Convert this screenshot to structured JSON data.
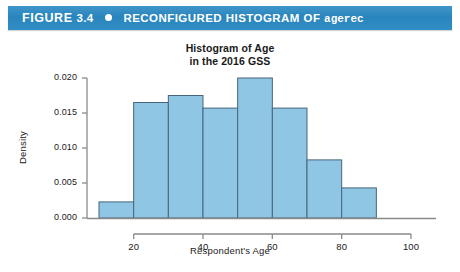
{
  "banner": {
    "figure_word": "FIGURE",
    "figure_number": "3.4",
    "bullet": "bullet-dot",
    "title_prefix": "RECONFIGURED HISTOGRAM OF ",
    "variable_name": "agerec",
    "banner_color": "#2f8ec4"
  },
  "chart_data": {
    "type": "bar",
    "title": "Histogram of Age",
    "subtitle": "in the 2016 GSS",
    "xlabel": "Respondent's Age",
    "ylabel": "Density",
    "bin_edges": [
      10,
      20,
      30,
      40,
      50,
      60,
      70,
      80,
      90
    ],
    "categories": [
      "10-20",
      "20-30",
      "30-40",
      "40-50",
      "50-60",
      "60-70",
      "70-80",
      "80-90"
    ],
    "values": [
      0.0023,
      0.0165,
      0.0175,
      0.0157,
      0.02,
      0.0157,
      0.0083,
      0.0043
    ],
    "xlim": [
      10,
      100
    ],
    "ylim": [
      0,
      0.02
    ],
    "xticks": [
      20,
      40,
      60,
      80,
      100
    ],
    "yticks": [
      0.0,
      0.005,
      0.01,
      0.015,
      0.02
    ],
    "ytick_labels": [
      "0.000",
      "0.005",
      "0.010",
      "0.015",
      "0.020"
    ],
    "xtick_labels": [
      "20",
      "40",
      "60",
      "80",
      "100"
    ],
    "grid": false,
    "legend": null,
    "bar_fill": "#8fc6e4",
    "bar_stroke": "#46657a"
  }
}
